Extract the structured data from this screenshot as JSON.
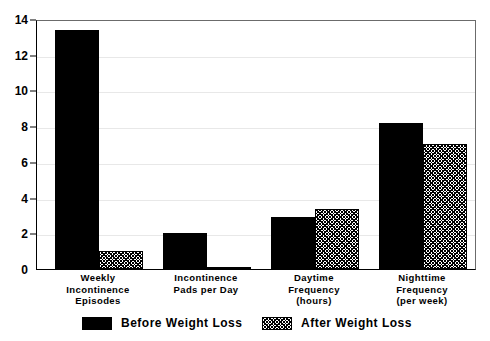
{
  "chart_data": {
    "type": "bar",
    "title": "",
    "subtitle": "",
    "xlabel": "",
    "ylabel": "",
    "ylim": [
      0,
      14
    ],
    "yticks": [
      0,
      2,
      4,
      6,
      8,
      10,
      12,
      14
    ],
    "grid": true,
    "legend_position": "bottom",
    "categories": [
      "Weekly\nIncontinence\nEpisodes",
      "Incontinence\nPads per Day",
      "Daytime\nFrequency\n(hours)",
      "Nighttime\nFrequency\n(per week)"
    ],
    "category_lines": [
      [
        "Weekly",
        "Incontinence",
        "Episodes"
      ],
      [
        "Incontinence",
        "Pads per Day"
      ],
      [
        "Daytime",
        "Frequency",
        "(hours)"
      ],
      [
        "Nighttime",
        "Frequency",
        "(per week)"
      ]
    ],
    "series": [
      {
        "name": "Before Weight Loss",
        "pattern": "solid",
        "color": "#000000",
        "values": [
          13.4,
          2.0,
          2.9,
          8.2
        ]
      },
      {
        "name": "After Weight Loss",
        "pattern": "hatched",
        "color": "#ffffff",
        "values": [
          1.0,
          0.1,
          3.35,
          7.0
        ]
      }
    ]
  },
  "axis": {
    "y_tick_labels": [
      "0",
      "2",
      "4",
      "6",
      "8",
      "10",
      "12",
      "14"
    ]
  },
  "legend": {
    "entries": [
      {
        "label": "Before Weight Loss",
        "swatch": "solid-black-swatch"
      },
      {
        "label": "After Weight Loss",
        "swatch": "hatched-swatch"
      }
    ]
  }
}
